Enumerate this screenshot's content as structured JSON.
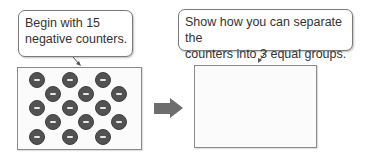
{
  "left_panel": {
    "callout_text_line1": "Begin with 15",
    "callout_text_line2": "negative counters.",
    "counter_count": 15,
    "counter_symbol": "minus",
    "counter_color": "#525252"
  },
  "right_panel": {
    "callout_text_line1": "Show how you can separate the",
    "callout_text_line2": "counters into 3 equal groups."
  },
  "arrow": {
    "icon": "right-arrow-icon",
    "color": "#6d6d6d"
  },
  "counters": [
    {
      "x": 37,
      "y": 80
    },
    {
      "x": 70,
      "y": 80
    },
    {
      "x": 103,
      "y": 80
    },
    {
      "x": 53,
      "y": 94
    },
    {
      "x": 86,
      "y": 94
    },
    {
      "x": 119,
      "y": 94
    },
    {
      "x": 37,
      "y": 108
    },
    {
      "x": 70,
      "y": 108
    },
    {
      "x": 103,
      "y": 108
    },
    {
      "x": 53,
      "y": 122
    },
    {
      "x": 86,
      "y": 122
    },
    {
      "x": 119,
      "y": 122
    },
    {
      "x": 37,
      "y": 137
    },
    {
      "x": 70,
      "y": 137
    },
    {
      "x": 103,
      "y": 137
    }
  ]
}
